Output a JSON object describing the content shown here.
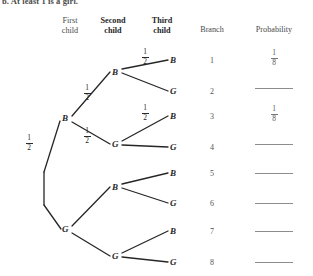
{
  "question": {
    "stem": "b. At least 1 is a girl."
  },
  "headers": [
    {
      "line1": "First",
      "line2": "child",
      "bold": false
    },
    {
      "line1": "Second",
      "line2": "child",
      "bold": true
    },
    {
      "line1": "Third",
      "line2": "child",
      "bold": true
    },
    {
      "line1": "Branch",
      "line2": "",
      "bold": false
    },
    {
      "line1": "Probability",
      "line2": "",
      "bold": false
    }
  ],
  "tree": {
    "root_label": "",
    "level1": [
      {
        "label": "B",
        "edge_prob_num": "1",
        "edge_prob_den": "2"
      },
      {
        "label": "G",
        "edge_prob_num": "",
        "edge_prob_den": ""
      }
    ],
    "level2": [
      {
        "label": "B",
        "edge_prob_num": "1",
        "edge_prob_den": "2"
      },
      {
        "label": "G",
        "edge_prob_num": "1",
        "edge_prob_den": "2"
      },
      {
        "label": "B",
        "edge_prob_num": "",
        "edge_prob_den": ""
      },
      {
        "label": "G",
        "edge_prob_num": "",
        "edge_prob_den": ""
      }
    ],
    "level3": [
      {
        "label": "B",
        "edge_prob_num": "1",
        "edge_prob_den": "2"
      },
      {
        "label": "G",
        "edge_prob_num": "",
        "edge_prob_den": ""
      },
      {
        "label": "B",
        "edge_prob_num": "1",
        "edge_prob_den": "2"
      },
      {
        "label": "G",
        "edge_prob_num": "",
        "edge_prob_den": ""
      },
      {
        "label": "B",
        "edge_prob_num": "",
        "edge_prob_den": ""
      },
      {
        "label": "G",
        "edge_prob_num": "",
        "edge_prob_den": ""
      },
      {
        "label": "B",
        "edge_prob_num": "",
        "edge_prob_den": ""
      },
      {
        "label": "G",
        "edge_prob_num": "",
        "edge_prob_den": ""
      }
    ]
  },
  "rows": [
    {
      "branch": "1",
      "outcome": "BBB",
      "prob_num": "1",
      "prob_den": "8",
      "filled": true
    },
    {
      "branch": "2",
      "outcome": "BBG",
      "prob_num": "",
      "prob_den": "",
      "filled": false
    },
    {
      "branch": "3",
      "outcome": "BGB",
      "prob_num": "1",
      "prob_den": "8",
      "filled": true
    },
    {
      "branch": "4",
      "outcome": "BGG",
      "prob_num": "",
      "prob_den": "",
      "filled": false
    },
    {
      "branch": "5",
      "outcome": "GBB",
      "prob_num": "",
      "prob_den": "",
      "filled": false
    },
    {
      "branch": "6",
      "outcome": "GBG",
      "prob_num": "",
      "prob_den": "",
      "filled": false
    },
    {
      "branch": "7",
      "outcome": "GGB",
      "prob_num": "",
      "prob_den": "",
      "filled": false
    },
    {
      "branch": "8",
      "outcome": "GGG",
      "prob_num": "",
      "prob_den": "",
      "filled": false
    }
  ],
  "colors": {
    "ink": "#262626",
    "faded_ink": "#555555",
    "rule": "#8d8d8d",
    "page": "#ffffff"
  }
}
